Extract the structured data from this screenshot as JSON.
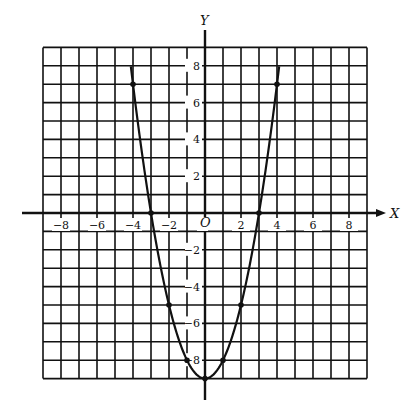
{
  "chart_data": {
    "type": "line",
    "title": "",
    "xlabel": "X",
    "ylabel": "Y",
    "origin_label": "O",
    "xlim": [
      -9,
      9
    ],
    "ylim": [
      -9,
      9
    ],
    "grid": true,
    "grid_step": 1,
    "x_ticks": [
      -8,
      -6,
      -4,
      -2,
      2,
      4,
      6,
      8
    ],
    "y_ticks": [
      8,
      6,
      4,
      2,
      -2,
      -4,
      -6,
      -8
    ],
    "x_tick_labels": [
      "−8",
      "−6",
      "−4",
      "−2",
      "2",
      "4",
      "6",
      "8"
    ],
    "y_tick_labels": [
      "8",
      "6",
      "4",
      "2",
      "−2",
      "−4",
      "−6",
      "−8"
    ],
    "series": [
      {
        "name": "y = x² − 9",
        "function": "x^2 - 9",
        "x_range": [
          -4.12,
          4.12
        ],
        "points": [
          {
            "x": -4,
            "y": 7
          },
          {
            "x": -3,
            "y": 0
          },
          {
            "x": -2,
            "y": -5
          },
          {
            "x": -1,
            "y": -8
          },
          {
            "x": 0,
            "y": -9
          },
          {
            "x": 1,
            "y": -8
          },
          {
            "x": 2,
            "y": -5
          },
          {
            "x": 3,
            "y": 0
          },
          {
            "x": 4,
            "y": 7
          }
        ]
      }
    ]
  },
  "colors": {
    "ink": "#111111",
    "background": "#ffffff"
  }
}
